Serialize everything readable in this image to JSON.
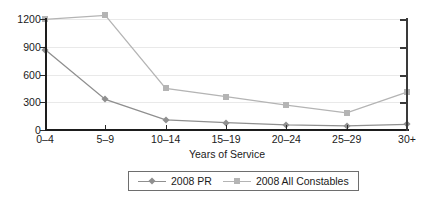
{
  "chart_data": {
    "type": "line",
    "title": "",
    "xlabel": "Years of Service",
    "ylabel": "No. of Officers",
    "categories": [
      "0–4",
      "5–9",
      "10–14",
      "15–19",
      "20–24",
      "25–29",
      "30+"
    ],
    "yticks": [
      0,
      300,
      600,
      900,
      1200
    ],
    "ylim": [
      0,
      1200
    ],
    "grid": true,
    "legend_position": "bottom-center",
    "series": [
      {
        "name": "2008 PR",
        "marker": "diamond",
        "color": "#8f8f8f",
        "values": [
          870,
          330,
          110,
          80,
          55,
          45,
          60
        ]
      },
      {
        "name": "2008 All Constables",
        "marker": "square",
        "color": "#b4b4b4",
        "values": [
          1195,
          1240,
          450,
          360,
          270,
          185,
          410
        ]
      }
    ]
  },
  "axes": {
    "y_title": "No. of Officers",
    "x_title": "Years of Service",
    "y_tick_labels": [
      "0",
      "300",
      "600",
      "900",
      "1200"
    ],
    "x_tick_labels": [
      "0–4",
      "5–9",
      "10–14",
      "15–19",
      "20–24",
      "25–29",
      "30+"
    ]
  },
  "legend": {
    "items": [
      {
        "label": "2008 PR",
        "marker": "diamond-marker",
        "color": "#8f8f8f"
      },
      {
        "label": "2008 All Constables",
        "marker": "square-marker",
        "color": "#b4b4b4"
      }
    ]
  },
  "colors": {
    "axis": "#1d1d1d",
    "grid": "#e9e9e9",
    "series_pr": "#8f8f8f",
    "series_all": "#b4b4b4",
    "background": "#ffffff"
  }
}
